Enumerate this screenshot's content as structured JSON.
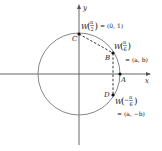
{
  "diagram": {
    "axes": {
      "x_label": "x",
      "y_label": "y"
    },
    "points": {
      "A": {
        "label": "A"
      },
      "B": {
        "label": "B",
        "func": "W",
        "arg_num": "π",
        "arg_den": "6",
        "value": "= (a, b)"
      },
      "C": {
        "label": "C",
        "func": "W",
        "arg_num": "π",
        "arg_den": "2",
        "value": "= (0, 1)"
      },
      "D": {
        "label": "D",
        "func": "W",
        "arg_sign": "−",
        "arg_num": "π",
        "arg_den": "6",
        "value": "= (a, −b)"
      }
    },
    "colors": {
      "circle": "#888888",
      "axis": "#555555",
      "point": "#111111",
      "dash": "#222222"
    }
  }
}
